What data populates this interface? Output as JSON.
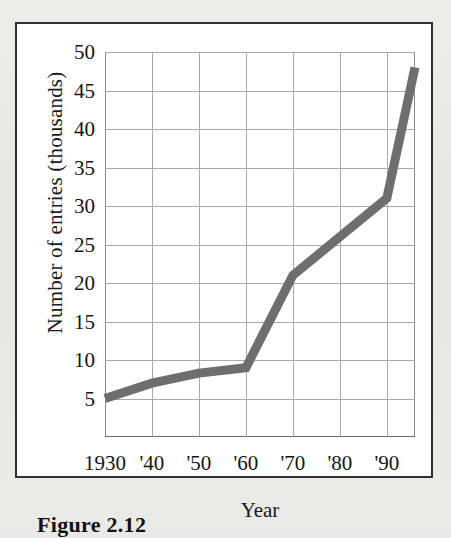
{
  "figure": {
    "caption": "Figure 2.12"
  },
  "chart_data": {
    "type": "line",
    "title": "",
    "xlabel": "Year",
    "ylabel": "Number of entries (thousands)",
    "xlim": [
      1930,
      1996
    ],
    "ylim": [
      0,
      50
    ],
    "grid": true,
    "legend": null,
    "line_color": "#6e6e6e",
    "line_width_px": 9,
    "x_tick_labels": [
      "1930",
      "'40",
      "'50",
      "'60",
      "'70",
      "'80",
      "'90"
    ],
    "x_tick_values": [
      1930,
      1940,
      1950,
      1960,
      1970,
      1980,
      1990
    ],
    "y_tick_labels": [
      "5",
      "10",
      "15",
      "20",
      "25",
      "30",
      "35",
      "40",
      "45",
      "50"
    ],
    "y_tick_values": [
      5,
      10,
      15,
      20,
      25,
      30,
      35,
      40,
      45,
      50
    ],
    "x": [
      1930,
      1940,
      1950,
      1960,
      1970,
      1980,
      1990,
      1996
    ],
    "values": [
      5,
      7,
      8.3,
      9,
      21,
      26,
      31,
      48
    ],
    "series": [
      {
        "name": "Number of entries",
        "x": [
          1930,
          1940,
          1950,
          1960,
          1970,
          1980,
          1990,
          1996
        ],
        "values": [
          5,
          7,
          8.3,
          9,
          21,
          26,
          31,
          48
        ]
      }
    ]
  }
}
